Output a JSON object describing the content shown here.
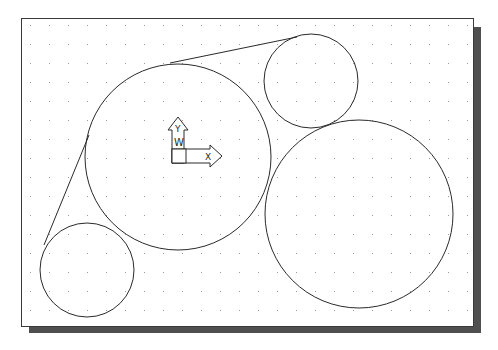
{
  "viewport": {
    "frame": {
      "x": 21,
      "y": 18,
      "width": 452,
      "height": 308
    },
    "shadow_color": "#4f4f4f",
    "frame_color": "#3a3a3a",
    "background": "#ffffff"
  },
  "grid": {
    "spacing": 19,
    "origin_x": 30,
    "origin_y": 25,
    "dot_color": "#9a9a9a"
  },
  "ucs_icon": {
    "x_label": "X",
    "y_label": "Y",
    "w_label": "W",
    "origin": {
      "x": 172,
      "y": 163
    }
  },
  "entities": {
    "circles": [
      {
        "name": "circle-large-left",
        "cx": 178,
        "cy": 157,
        "r": 93
      },
      {
        "name": "circle-small-top-right",
        "cx": 311,
        "cy": 81,
        "r": 47
      },
      {
        "name": "circle-large-right",
        "cx": 359,
        "cy": 214,
        "r": 94
      },
      {
        "name": "circle-small-bottom-left",
        "cx": 87,
        "cy": 270,
        "r": 47
      }
    ],
    "lines": [
      {
        "name": "tangent-line-left",
        "x1": 89,
        "y1": 135,
        "x2": 44,
        "y2": 245
      },
      {
        "name": "tangent-line-top",
        "x1": 170,
        "y1": 63,
        "x2": 297,
        "y2": 37
      }
    ],
    "stroke_color": "#2a2a2a"
  }
}
